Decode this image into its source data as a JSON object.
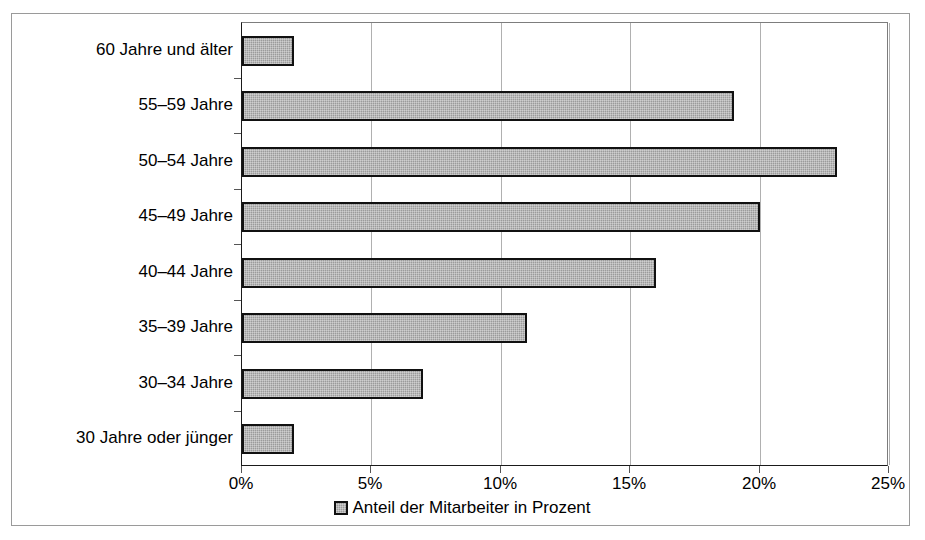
{
  "chart_data": {
    "type": "bar",
    "orientation": "horizontal",
    "title": "",
    "subtitle": "",
    "xlabel": "",
    "ylabel": "",
    "categories": [
      "60 Jahre und älter",
      "55–59 Jahre",
      "50–54 Jahre",
      "45–49 Jahre",
      "40–44 Jahre",
      "35–39 Jahre",
      "30–34 Jahre",
      "30 Jahre oder jünger"
    ],
    "values": [
      2,
      19,
      23,
      20,
      16,
      11,
      7,
      2
    ],
    "series": [
      {
        "name": "Anteil der Mitarbeiter in Prozent",
        "values": [
          2,
          19,
          23,
          20,
          16,
          11,
          7,
          2
        ]
      }
    ],
    "xlim": [
      0,
      25
    ],
    "xticks": [
      0,
      5,
      10,
      15,
      20,
      25
    ],
    "xticklabels": [
      "0%",
      "5%",
      "10%",
      "15%",
      "20%",
      "25%"
    ],
    "grid": "vertical",
    "legend": {
      "position": "bottom-center",
      "entries": [
        "Anteil der Mitarbeiter in Prozent"
      ]
    },
    "colors": {
      "bar_fill": "#9b9b9b",
      "bar_border": "#111111",
      "gridline": "#b0b0b0",
      "axis": "#1a1a1a",
      "text": "#000000",
      "background": "#ffffff",
      "frame": "#9a9a9a"
    }
  }
}
